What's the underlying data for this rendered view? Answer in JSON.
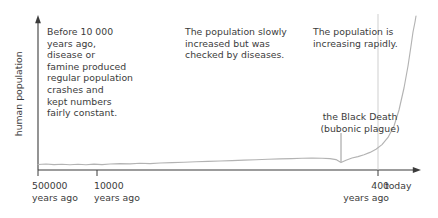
{
  "chart_data": {
    "type": "line",
    "title": "",
    "xlabel": "",
    "ylabel": "human population",
    "x_tick_labels": [
      "500000\nyears ago",
      "10000\nyears ago",
      "400\nyears ago",
      "today"
    ],
    "x_tick_positions": [
      38,
      97,
      378,
      420
    ],
    "grid": false,
    "legend": null,
    "axis_color": "#3b3b3b",
    "curve_color": "#b3b3b3",
    "text_color": "#3b3b3b",
    "series": [
      {
        "name": "human population",
        "points": [
          [
            38,
            164.5
          ],
          [
            46,
            164.0
          ],
          [
            54,
            164.6
          ],
          [
            62,
            164.2
          ],
          [
            70,
            164.8
          ],
          [
            78,
            164.3
          ],
          [
            86,
            164.7
          ],
          [
            94,
            164.1
          ],
          [
            102,
            164.6
          ],
          [
            110,
            164.0
          ],
          [
            120,
            163.6
          ],
          [
            130,
            163.9
          ],
          [
            140,
            163.3
          ],
          [
            150,
            163.6
          ],
          [
            160,
            163.0
          ],
          [
            172,
            162.6
          ],
          [
            184,
            162.2
          ],
          [
            196,
            161.8
          ],
          [
            208,
            161.4
          ],
          [
            220,
            161.0
          ],
          [
            232,
            160.6
          ],
          [
            244,
            160.1
          ],
          [
            256,
            159.7
          ],
          [
            268,
            159.3
          ],
          [
            280,
            158.9
          ],
          [
            292,
            158.6
          ],
          [
            302,
            158.3
          ],
          [
            312,
            158.1
          ],
          [
            322,
            158.2
          ],
          [
            330,
            158.6
          ],
          [
            336,
            159.6
          ],
          [
            341,
            162.6
          ],
          [
            346,
            160.2
          ],
          [
            352,
            158.0
          ],
          [
            358,
            156.6
          ],
          [
            364,
            154.8
          ],
          [
            370,
            152.4
          ],
          [
            376,
            149.2
          ],
          [
            382,
            144.6
          ],
          [
            388,
            137.4
          ],
          [
            394,
            126.0
          ],
          [
            399,
            110.0
          ],
          [
            404,
            88.0
          ],
          [
            408,
            66.0
          ],
          [
            411,
            46.0
          ],
          [
            413,
            32.0
          ],
          [
            415,
            22.0
          ],
          [
            416,
            16.0
          ]
        ]
      }
    ],
    "annotations": [
      {
        "id": "early",
        "text": "Before 10 000\nyears ago,\ndisease or\nfamine produced\nregular population\ncrashes and\nfairly constant."
      },
      {
        "id": "slow",
        "text": "The population slowly\nincreased but was\nchecked by diseases."
      },
      {
        "id": "rapid",
        "text": "The population is\nincreasing rapidly."
      },
      {
        "id": "plague",
        "text": "the Black Death\n(bubonic plague)"
      }
    ]
  },
  "chart": {
    "y_axis_label": "human population",
    "ticks": {
      "tick_0": "500000\nyears ago",
      "tick_1": "10000\nyears ago",
      "tick_2": "400\nyears ago",
      "tick_3": "today"
    },
    "notes": {
      "early": "Before 10 000\nyears ago,\ndisease or\nfamine produced\nregular population\ncrashes and\nkept numbers\nfairly constant.",
      "slow": "The population slowly\nincreased but was\nchecked by diseases.",
      "rapid": "The population is\nincreasing rapidly.",
      "plague": "the Black Death\n(bubonic plague)"
    }
  }
}
